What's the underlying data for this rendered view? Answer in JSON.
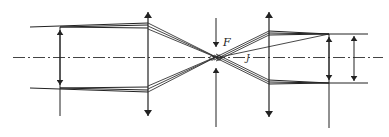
{
  "diagram": {
    "type": "optical-ray-diagram",
    "labels": {
      "focus": "F",
      "angle": "J"
    },
    "colors": {
      "line": "#222222",
      "ray": "#333333",
      "axis": "#444444",
      "background": "#ffffff"
    },
    "elements": [
      {
        "name": "optical-axis",
        "kind": "dash-dot line"
      },
      {
        "name": "input-aperture-arrow",
        "kind": "double arrow"
      },
      {
        "name": "lens-1",
        "kind": "converging lens (double arrow)"
      },
      {
        "name": "focal-stop",
        "kind": "aperture arrows at F"
      },
      {
        "name": "lens-2",
        "kind": "converging lens (double arrow)"
      },
      {
        "name": "output-aperture-arrow",
        "kind": "double arrow"
      },
      {
        "name": "output-dimension-arrow",
        "kind": "dimension double arrow"
      }
    ]
  }
}
